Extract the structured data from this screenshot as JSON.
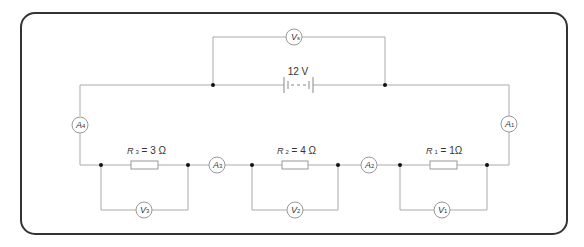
{
  "diagram": {
    "title": "",
    "colors": {
      "frame": "#333333",
      "wire": "#aaaaaa",
      "node": "#111111",
      "text": "#333333"
    },
    "battery": {
      "label": "12 V"
    },
    "meters": {
      "vs": {
        "letter": "V",
        "sub": "s"
      },
      "a4": {
        "letter": "A",
        "sub": "4"
      },
      "a1": {
        "letter": "A",
        "sub": "1"
      },
      "a3": {
        "letter": "A",
        "sub": "3"
      },
      "a2": {
        "letter": "A",
        "sub": "2"
      },
      "v3": {
        "letter": "V",
        "sub": "3"
      },
      "v2": {
        "letter": "V",
        "sub": "2"
      },
      "v1": {
        "letter": "V",
        "sub": "1"
      }
    },
    "resistors": {
      "r3": {
        "letter": "R",
        "sub": "3",
        "value": " = 3 Ω"
      },
      "r2": {
        "letter": "R",
        "sub": "2",
        "value": " = 4 Ω"
      },
      "r1": {
        "letter": "R",
        "sub": "1",
        "value": " = 1Ω"
      }
    }
  }
}
